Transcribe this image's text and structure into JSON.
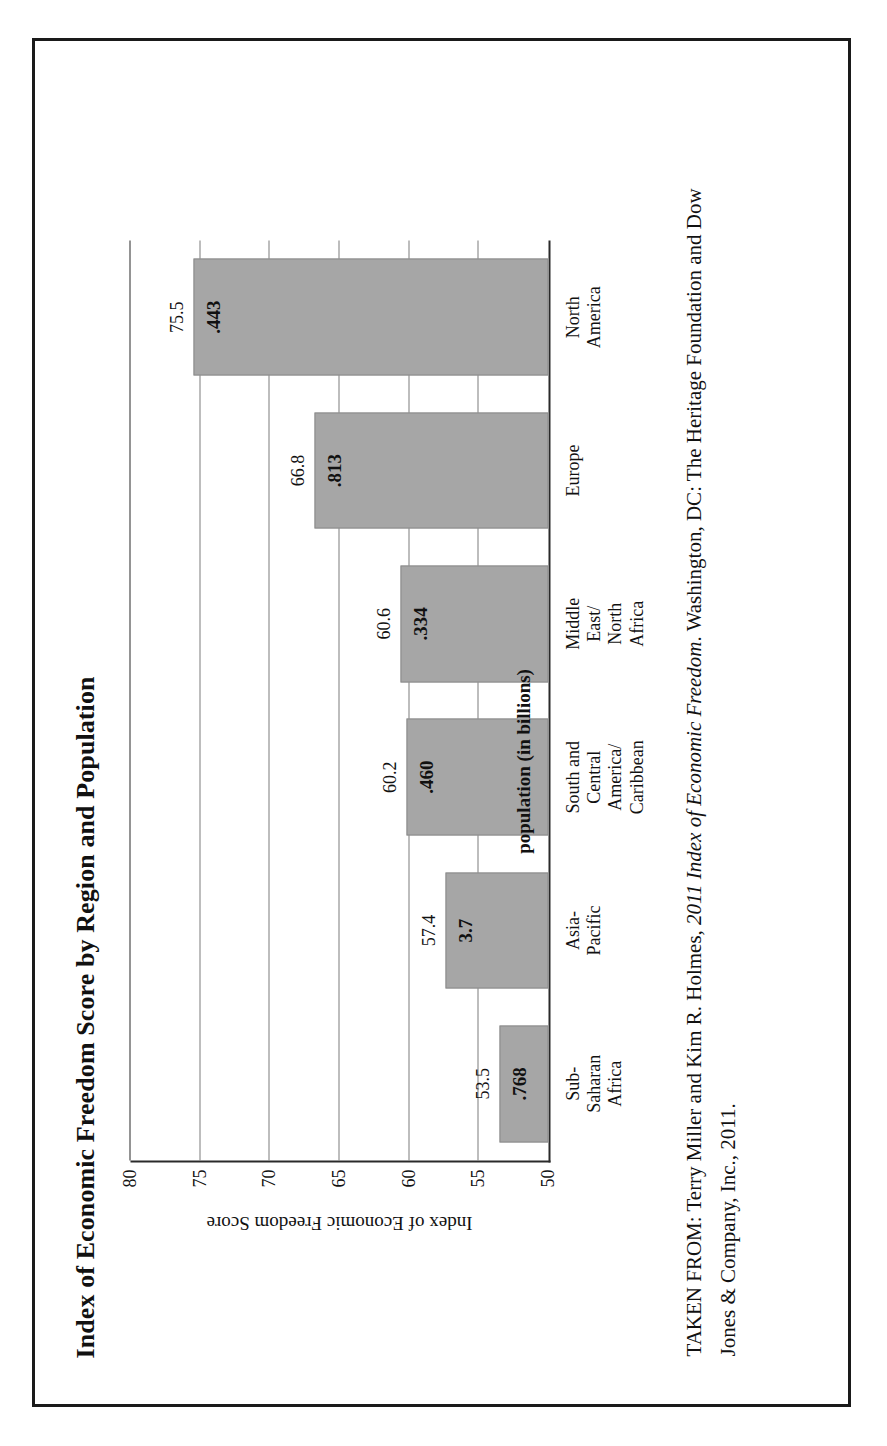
{
  "figure": {
    "title": "Index of Economic Freedom Score by Region and Population",
    "series_note": "population (in billions)"
  },
  "citation": {
    "prefix": "TAKEN FROM: Terry Miller and Kim R. Holmes, ",
    "italic_work": "2011 Index of Economic Freedom",
    "suffix": ". Washington, DC: The Heritage Foundation and Dow Jones & Company, Inc., 2011."
  },
  "chart_data": {
    "type": "bar",
    "title": "Index of Economic Freedom Score by Region and Population",
    "xlabel": "",
    "ylabel": "Index of Economic Freedom Score",
    "ylim": [
      50,
      80
    ],
    "yticks": [
      "50",
      "55",
      "60",
      "65",
      "70",
      "75",
      "80"
    ],
    "grid": true,
    "legend": "population (in billions)",
    "categories": [
      "Sub-Saharan\nAfrica",
      "Asia-Pacific",
      "South and\nCentral America/\nCaribbean",
      "Middle East/\nNorth Africa",
      "Europe",
      "North America"
    ],
    "values": [
      53.5,
      57.4,
      60.2,
      60.6,
      66.8,
      75.5
    ],
    "value_labels": [
      "53.5",
      "57.4",
      "60.2",
      "60.6",
      "66.8",
      "75.5"
    ],
    "population_labels": [
      ".768",
      "3.7",
      ".460",
      ".334",
      ".813",
      ".443"
    ],
    "population_values": [
      0.768,
      3.7,
      0.46,
      0.334,
      0.813,
      0.443
    ],
    "bar_color": "#a6a6a6"
  }
}
